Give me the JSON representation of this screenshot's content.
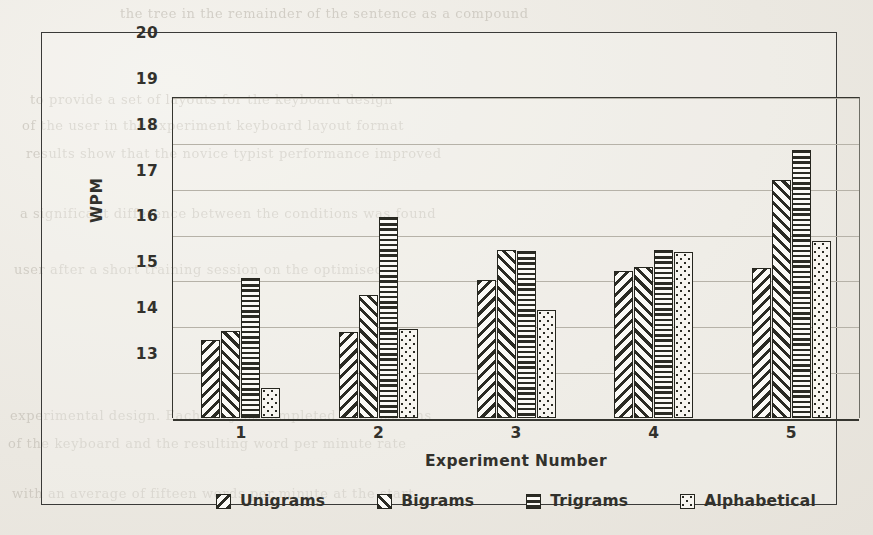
{
  "chart_data": {
    "type": "bar",
    "title": "",
    "xlabel": "Experiment  Number",
    "ylabel": "WPM",
    "categories": [
      "1",
      "2",
      "3",
      "4",
      "5"
    ],
    "ylim": [
      13,
      20
    ],
    "yticks": [
      13,
      14,
      15,
      16,
      17,
      18,
      19,
      20
    ],
    "grid": true,
    "legend_position": "bottom",
    "series": [
      {
        "name": "Unigrams",
        "pattern": "diagonal-down-stripes",
        "values": [
          14.7,
          14.88,
          16.0,
          16.2,
          16.27
        ]
      },
      {
        "name": "Bigrams",
        "pattern": "diagonal-up-stripes",
        "values": [
          14.9,
          15.68,
          16.67,
          16.3,
          18.2
        ]
      },
      {
        "name": "Trigrams",
        "pattern": "horizontal-stripes",
        "values": [
          16.05,
          17.38,
          16.65,
          16.67,
          18.85
        ]
      },
      {
        "name": "Alphabetical",
        "pattern": "dotted",
        "values": [
          13.65,
          14.95,
          15.35,
          16.63,
          16.87
        ]
      }
    ]
  },
  "axes": {
    "y_tick_labels": [
      "20",
      "19",
      "18",
      "17",
      "16",
      "15",
      "14",
      "13"
    ],
    "y_axis_title": "WPM",
    "x_tick_labels": [
      "1",
      "2",
      "3",
      "4",
      "5"
    ],
    "x_axis_title": "Experiment  Number"
  },
  "legend": {
    "items": [
      {
        "label": "Unigrams",
        "swatch": "diagonal-down-stripes-swatch"
      },
      {
        "label": "Bigrams",
        "swatch": "diagonal-up-stripes-swatch"
      },
      {
        "label": "Trigrams",
        "swatch": "horizontal-stripes-swatch"
      },
      {
        "label": "Alphabetical",
        "swatch": "dotted-swatch"
      }
    ]
  },
  "page": {
    "background_bleed_text": [
      "the tree  in  the  remainder  of  the  sentence  as  a  compound",
      "to  provide  a  set  of  layouts  for  the  keyboard  design",
      "of  the  user  in  the  experiment  keyboard  layout  format",
      "results  show  that  the  novice  typist  performance  improved",
      "a  significant  difference  between  the  conditions  was  found",
      "user  after  a  short  training  session  on  the  optimised",
      "experimental  design.  Each  subject  completed  five  sessions",
      "of  the  keyboard  and  the  resulting  word  per  minute  rate",
      "with  an  average  of  fifteen  words  per  minute  at  the  start"
    ]
  },
  "colors": {
    "paper": "#efece6",
    "ink": "#2b2b24",
    "gridline": "#b6b2a8",
    "axis": "#35352f"
  }
}
